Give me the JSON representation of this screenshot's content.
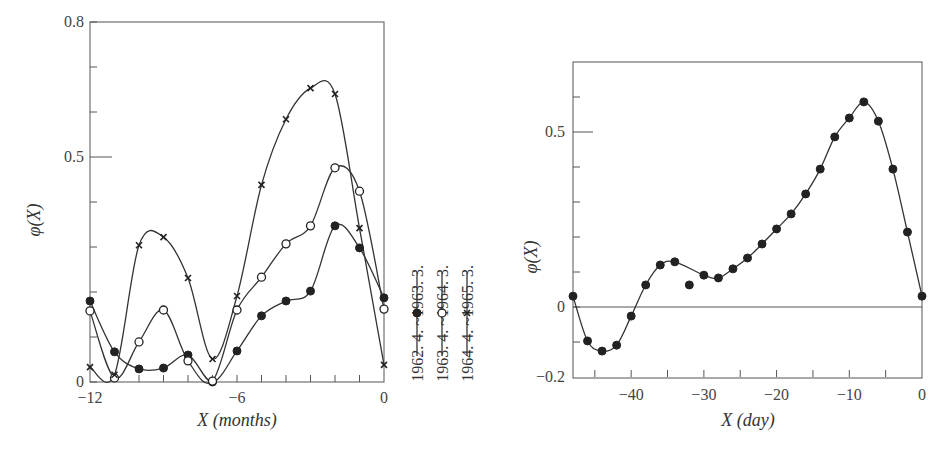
{
  "chart_data": [
    {
      "type": "line",
      "title": "",
      "xlabel": "X (months)",
      "ylabel": "φ(X)",
      "xlim": [
        -12,
        0
      ],
      "ylim": [
        0,
        0.8
      ],
      "x_ticks": [
        -12,
        -11,
        -10,
        -9,
        -8,
        -7,
        -6,
        -5,
        -4,
        -3,
        -2,
        -1,
        0
      ],
      "x_tick_labels": [
        "-12",
        "",
        "",
        "",
        "",
        "",
        "-6",
        "",
        "",
        "",
        "",
        "",
        "0"
      ],
      "y_ticks": [
        0,
        0.1,
        0.2,
        0.3,
        0.4,
        0.5,
        0.6,
        0.7,
        0.8
      ],
      "y_tick_labels": [
        "0",
        "",
        "",
        "",
        "",
        "0.5",
        "",
        "",
        "0.8"
      ],
      "grid": false,
      "legend_placement": "right-outside",
      "x": [
        -12,
        -11,
        -10,
        -9,
        -8,
        -7,
        -6,
        -5,
        -4,
        -3,
        -2,
        -1,
        0
      ],
      "series": [
        {
          "name": "1962. 4. ~1963. 3.",
          "marker": "filled-circle",
          "values": [
            0.18,
            0.067,
            0.029,
            0.031,
            0.06,
            0.0,
            0.069,
            0.147,
            0.18,
            0.202,
            0.347,
            0.298,
            0.187
          ]
        },
        {
          "name": "1963. 4. ~1964. 3.",
          "marker": "open-circle",
          "values": [
            0.158,
            0.009,
            0.089,
            0.16,
            0.047,
            0.002,
            0.16,
            0.233,
            0.307,
            0.347,
            0.476,
            0.424,
            0.162
          ]
        },
        {
          "name": "1964. 4. ~1965. 3.",
          "marker": "cross",
          "values": [
            0.033,
            0.016,
            0.304,
            0.322,
            0.231,
            0.051,
            0.191,
            0.438,
            0.584,
            0.653,
            0.64,
            0.342,
            0.038
          ]
        }
      ]
    },
    {
      "type": "line",
      "title": "",
      "xlabel": "X (day)",
      "ylabel": "φ(X)",
      "xlim": [
        -48,
        0
      ],
      "ylim": [
        -0.2,
        0.7
      ],
      "x_ticks": [
        -45,
        -40,
        -35,
        -30,
        -25,
        -20,
        -15,
        -10,
        -5,
        0
      ],
      "x_tick_labels": [
        "",
        "-40",
        "",
        "-30",
        "",
        "-20",
        "",
        "-10",
        "",
        "0"
      ],
      "y_ticks": [
        -0.2,
        -0.1,
        0,
        0.1,
        0.2,
        0.3,
        0.4,
        0.5,
        0.6
      ],
      "y_tick_labels": [
        "-0.2",
        "",
        "0",
        "",
        "",
        "",
        "",
        "0.5",
        ""
      ],
      "zero_line": true,
      "grid": false,
      "x": [
        -48,
        -46,
        -44,
        -42,
        -40,
        -38,
        -36,
        -34,
        -32,
        -30,
        -28,
        -26,
        -24,
        -22,
        -20,
        -18,
        -16,
        -14,
        -12,
        -10,
        -8,
        -6,
        -4,
        -2,
        0
      ],
      "series": [
        {
          "name": "φ(X)",
          "marker": "filled-circle",
          "values": [
            0.031,
            -0.097,
            -0.126,
            -0.109,
            -0.026,
            0.063,
            0.12,
            0.129,
            0.063,
            0.091,
            0.083,
            0.109,
            0.14,
            0.18,
            0.223,
            0.266,
            0.323,
            0.394,
            0.486,
            0.54,
            0.586,
            0.531,
            0.394,
            0.214,
            0.031
          ]
        }
      ]
    }
  ]
}
